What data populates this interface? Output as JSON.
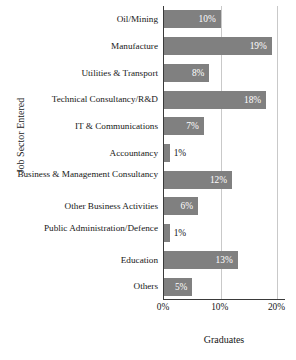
{
  "chart_data": {
    "type": "bar",
    "orientation": "horizontal",
    "title": "",
    "xlabel": "Graduates",
    "ylabel": "Job Sector Entered",
    "categories": [
      "Oil/Mining",
      "Manufacture",
      "Utilities & Transport",
      "Technical Consultancy/R&D",
      "IT & Communications",
      "Accountancy",
      "Business & Management Consultancy",
      "Other Business Activities",
      "Public Administration/Defence",
      "Education",
      "Others"
    ],
    "values": [
      10,
      19,
      8,
      18,
      7,
      1,
      12,
      6,
      1,
      13,
      5
    ],
    "value_labels": [
      "10%",
      "19%",
      "8%",
      "18%",
      "7%",
      "1%",
      "12%",
      "6%",
      "1%",
      "13%",
      "5%"
    ],
    "xlim": [
      0,
      21.5
    ],
    "xticks": [
      0,
      10,
      20
    ],
    "xtick_labels": [
      "0%",
      "10%",
      "20%"
    ],
    "grid": "vertical-at-xticks",
    "legend": "none",
    "bar_color": "#808080",
    "inside_label_color": "#ffffff",
    "outside_label_color": "#171717",
    "axis_color": "#3a3a3a",
    "gridline_color": "#c9c9c9",
    "background": "#ffffff"
  }
}
